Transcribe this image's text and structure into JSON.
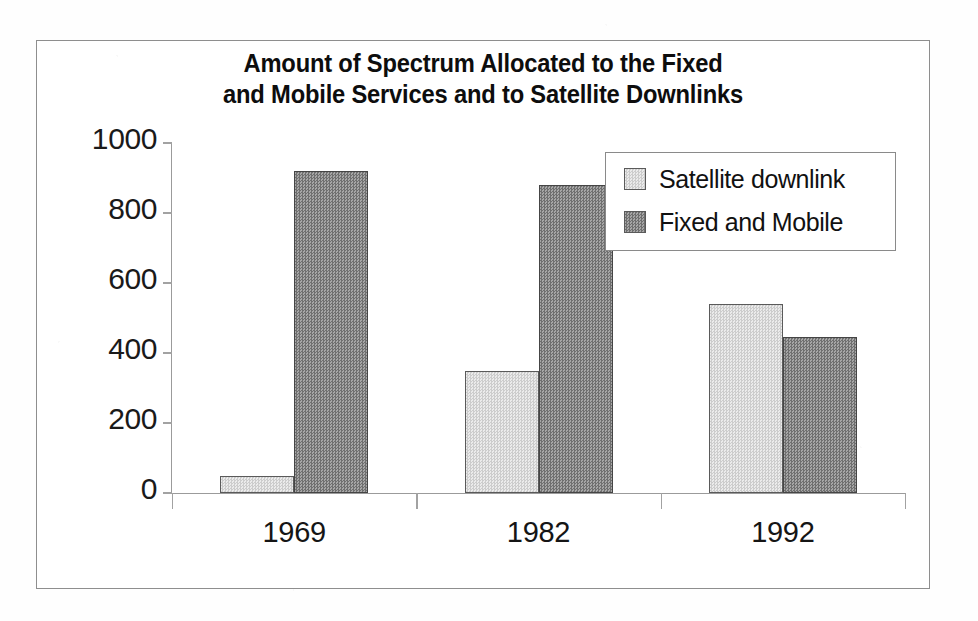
{
  "chart_data": {
    "type": "bar",
    "title": "Amount of Spectrum Allocated to the Fixed\nand Mobile Services and to Satellite Downlinks",
    "xlabel": "",
    "ylabel": "",
    "categories": [
      "1969",
      "1982",
      "1992"
    ],
    "series": [
      {
        "name": "Satellite downlink",
        "values": [
          50,
          350,
          540
        ],
        "color": "#d9d9d9"
      },
      {
        "name": "Fixed and Mobile",
        "values": [
          920,
          880,
          445
        ],
        "color": "#8c8c8c"
      }
    ],
    "ylim": [
      0,
      1000
    ],
    "yticks": [
      0,
      200,
      400,
      600,
      800,
      1000
    ],
    "ytick_labels": [
      "0",
      "200",
      "400",
      "600",
      "800",
      "1000"
    ],
    "grid": false,
    "legend_position": "top-right"
  },
  "legend": {
    "items": [
      {
        "label": "Satellite downlink",
        "swatch": "light"
      },
      {
        "label": "Fixed and Mobile",
        "swatch": "dark"
      }
    ]
  },
  "colors": {
    "bar_light": "#d9d9d9",
    "bar_dark": "#8c8c8c",
    "axis": "#9b9b9b",
    "frame": "#8e8e8e",
    "text": "#111111"
  }
}
